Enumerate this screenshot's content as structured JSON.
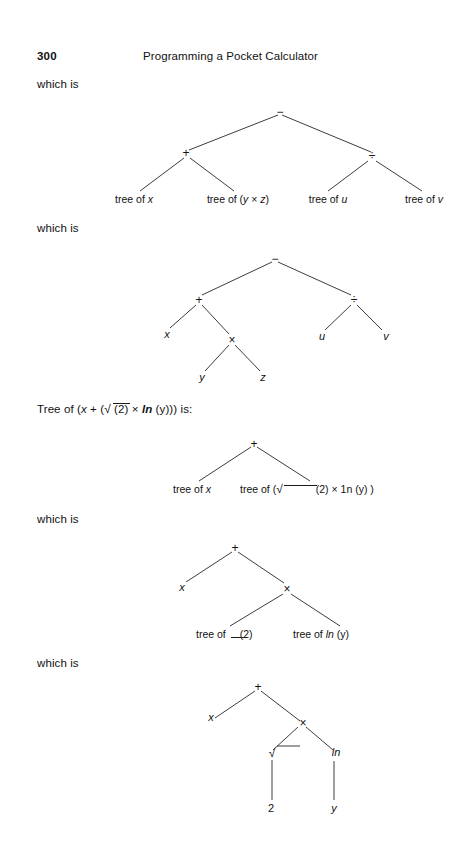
{
  "page": {
    "number": "300",
    "running_title": "Programming a Pocket Calculator"
  },
  "text_lines": {
    "which_is_1": "which is",
    "which_is_2": "which is",
    "tree_of_expr": "Tree of (x + (√ (2) × ln (y))) is:",
    "tree_of_prefix": "Tree of (x + (",
    "tree_of_mid": "(2) × ln (y))) is:",
    "which_is_3": "which is",
    "which_is_4": "which is"
  },
  "trees": [
    {
      "id": "tree-1",
      "caption": "which is",
      "nodes": [
        {
          "name": "root-minus",
          "label": "−"
        },
        {
          "name": "plus",
          "label": "+"
        },
        {
          "name": "divide",
          "label": "÷"
        }
      ],
      "leaves": [
        {
          "name": "leaf-tree-of-x",
          "label": "tree of ",
          "italic": "x"
        },
        {
          "name": "leaf-tree-of-y-times-z",
          "label": "tree of (",
          "italic": "y",
          "mid": " × ",
          "italic2": "z",
          "suffix": ")"
        },
        {
          "name": "leaf-tree-of-u",
          "label": "tree of ",
          "italic": "u"
        },
        {
          "name": "leaf-tree-of-v",
          "label": "tree of ",
          "italic": "v"
        }
      ]
    },
    {
      "id": "tree-2",
      "caption": "which is",
      "nodes": [
        {
          "name": "root-minus",
          "label": "−"
        },
        {
          "name": "plus",
          "label": "+"
        },
        {
          "name": "divide",
          "label": "÷"
        },
        {
          "name": "times",
          "label": "×"
        }
      ],
      "leaves": [
        {
          "name": "leaf-x",
          "label": "x"
        },
        {
          "name": "leaf-u",
          "label": "u"
        },
        {
          "name": "leaf-v",
          "label": "v"
        },
        {
          "name": "leaf-y",
          "label": "y"
        },
        {
          "name": "leaf-z",
          "label": "z"
        }
      ]
    },
    {
      "id": "tree-3",
      "caption": "Tree of (x + (√ (2) × ln (y))) is:",
      "nodes": [
        {
          "name": "root-plus",
          "label": "+"
        }
      ],
      "leaves": [
        {
          "name": "leaf-tree-of-x",
          "label": "tree of ",
          "italic": "x"
        },
        {
          "name": "leaf-tree-of-sqrt2-times-ln-y",
          "label": "tree of ( ",
          "suffix": "(2) × 1n (y) )"
        }
      ]
    },
    {
      "id": "tree-4",
      "caption": "which is",
      "nodes": [
        {
          "name": "root-plus",
          "label": "+"
        },
        {
          "name": "times",
          "label": "×"
        }
      ],
      "leaves": [
        {
          "name": "leaf-x",
          "label": "x"
        },
        {
          "name": "leaf-tree-of-sqrt",
          "label": "tree of",
          "suffix": "(2)"
        },
        {
          "name": "leaf-tree-of-ln-y",
          "label": "tree of ",
          "italic": "ln",
          "suffix": " (y)"
        }
      ]
    },
    {
      "id": "tree-5",
      "caption": "which is",
      "nodes": [
        {
          "name": "root-plus",
          "label": "+"
        },
        {
          "name": "times",
          "label": "×"
        },
        {
          "name": "sqrt",
          "label": "√"
        },
        {
          "name": "ln",
          "label": "ln"
        }
      ],
      "leaves": [
        {
          "name": "leaf-x",
          "label": "x"
        },
        {
          "name": "leaf-2",
          "label": "2"
        },
        {
          "name": "leaf-y",
          "label": "y"
        }
      ]
    }
  ],
  "labels": {
    "t1_root": "−",
    "t1_plus": "+",
    "t1_div": "÷",
    "t1_leaf1_a": "tree of ",
    "t1_leaf1_b": "x",
    "t1_leaf2_a": "tree of (",
    "t1_leaf2_b": "y",
    "t1_leaf2_c": " × ",
    "t1_leaf2_d": "z",
    "t1_leaf2_e": ")",
    "t1_leaf3_a": "tree of ",
    "t1_leaf3_b": "u",
    "t1_leaf4_a": "tree of ",
    "t1_leaf4_b": "v",
    "t2_root": "−",
    "t2_plus": "+",
    "t2_div": "÷",
    "t2_times": "×",
    "t2_x": "x",
    "t2_u": "u",
    "t2_v": "v",
    "t2_y": "y",
    "t2_z": "z",
    "t3_root": "+",
    "t3_leaf1_a": "tree of ",
    "t3_leaf1_b": "x",
    "t3_leaf2_a": "tree of (",
    "t3_leaf2_b": "(2) × 1n (y) )",
    "t4_root": "+",
    "t4_times": "×",
    "t4_x": "x",
    "t4_leaf_sqrt_a": "tree of",
    "t4_leaf_sqrt_b": "(2)",
    "t4_leaf_ln_a": "tree of ",
    "t4_leaf_ln_b": "ln",
    "t4_leaf_ln_c": " (y)",
    "t5_root": "+",
    "t5_times": "×",
    "t5_sqrt": "√",
    "t5_ln": "ln",
    "t5_x": "x",
    "t5_2": "2",
    "t5_y": "y",
    "expr_prefix": "Tree of (",
    "expr_x": "x",
    "expr_plus": " + (",
    "expr_sqrt": "√",
    "expr_mid": " (2) × ",
    "expr_ln": "ln",
    "expr_tail": " (y))) is:"
  },
  "colors": {
    "ink": "#1a1a1a",
    "paper": "#ffffff"
  }
}
